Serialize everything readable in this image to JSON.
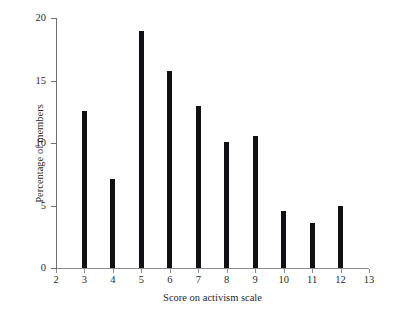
{
  "figure": {
    "caption_strip": "",
    "background_color": "#ffffff",
    "bar_color": "#111114",
    "axis_color": "#6e6e74"
  },
  "chart_data": {
    "type": "bar",
    "title": "",
    "xlabel": "Score on activism scale",
    "ylabel": "Percentage of members",
    "categories": [
      3,
      4,
      5,
      6,
      7,
      8,
      9,
      10,
      11,
      12
    ],
    "values": [
      12.6,
      7.1,
      19.0,
      15.8,
      13.0,
      10.1,
      10.6,
      4.6,
      3.6,
      5.0
    ],
    "xlim": [
      2,
      13
    ],
    "ylim": [
      0,
      20
    ],
    "x_tick_labels": [
      "2",
      "3",
      "4",
      "5",
      "6",
      "7",
      "8",
      "9",
      "10",
      "11",
      "12",
      "13"
    ],
    "x_tick_values": [
      2,
      3,
      4,
      5,
      6,
      7,
      8,
      9,
      10,
      11,
      12,
      13
    ],
    "y_tick_labels": [
      "0",
      "5",
      "10",
      "15",
      "20"
    ],
    "y_tick_values": [
      0,
      5,
      10,
      15,
      20
    ],
    "grid": false,
    "legend": false
  }
}
